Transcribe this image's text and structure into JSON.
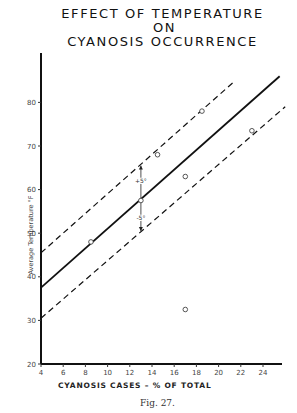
{
  "chart_data": {
    "type": "scatter",
    "title_lines": [
      "EFFECT OF TEMPERATURE",
      "ON",
      "CYANOSIS  OCCURRENCE"
    ],
    "xlabel": "CYANOSIS CASES – % OF TOTAL",
    "ylabel": "Average Temperature °F",
    "xlim": [
      4,
      26
    ],
    "ylim": [
      20,
      90
    ],
    "x_ticks": [
      4,
      6,
      8,
      10,
      12,
      14,
      16,
      18,
      20,
      22,
      24
    ],
    "y_ticks": [
      20,
      30,
      40,
      50,
      60,
      70,
      80
    ],
    "grid": false,
    "points": [
      {
        "x": 8.5,
        "y": 48
      },
      {
        "x": 13,
        "y": 57.5
      },
      {
        "x": 14.5,
        "y": 68
      },
      {
        "x": 17,
        "y": 63
      },
      {
        "x": 18.5,
        "y": 78
      },
      {
        "x": 23,
        "y": 73.5
      },
      {
        "x": 17,
        "y": 32.5
      }
    ],
    "series": [
      {
        "name": "regression line",
        "style": "solid",
        "x": [
          4,
          25.5
        ],
        "y": [
          37.5,
          86
        ]
      },
      {
        "name": "+5° band",
        "style": "dashed",
        "x": [
          4,
          21.5
        ],
        "y": [
          45.5,
          85
        ]
      },
      {
        "name": "-5° band",
        "style": "dashed",
        "x": [
          4,
          26
        ],
        "y": [
          30.5,
          79
        ]
      }
    ],
    "annotations": [
      {
        "text": "+5°",
        "x": 13,
        "y": 62
      },
      {
        "text": "-5°",
        "x": 13,
        "y": 53.5
      }
    ]
  },
  "caption": "Fig. 27."
}
